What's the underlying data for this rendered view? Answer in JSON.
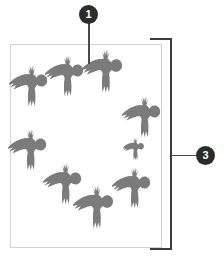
{
  "figure": {
    "title": "",
    "background_color": "#ffffff",
    "width": 224,
    "height": 258
  },
  "frame": {
    "name": "inner-field-rectangle",
    "stroke_color": "#d2d2d2",
    "x": 10,
    "y": 44,
    "width": 152,
    "height": 204
  },
  "bracket": {
    "name": "right-side-bracket",
    "stroke_color": "#3b3b3b",
    "x": 150,
    "y": 38,
    "width": 22,
    "height": 212
  },
  "callouts": [
    {
      "id": "1",
      "label": "1",
      "circle_color": "#2b2b2b",
      "text_color": "#ffffff",
      "cx": 88,
      "cy": 14,
      "leader": {
        "x": 88,
        "y": 22,
        "length": 42,
        "orientation": "vertical"
      }
    },
    {
      "id": "3",
      "label": "3",
      "circle_color": "#2b2b2b",
      "text_color": "#ffffff",
      "cx": 205,
      "cy": 155,
      "leader": {
        "x": 172,
        "y": 155,
        "length": 25,
        "orientation": "horizontal"
      }
    }
  ],
  "birds": {
    "name": "flying-bird-silhouettes",
    "fill_color": "#7b7b7b",
    "count": 9,
    "arrangement": "ring",
    "items": [
      {
        "index": 1,
        "x": 9,
        "y": 62,
        "scale": 1.0,
        "rotate": 0
      },
      {
        "index": 2,
        "x": 45,
        "y": 52,
        "scale": 1.0,
        "rotate": 0
      },
      {
        "index": 3,
        "x": 82,
        "y": 46,
        "scale": 1.05,
        "rotate": 0
      },
      {
        "index": 4,
        "x": 122,
        "y": 93,
        "scale": 1.0,
        "rotate": 0
      },
      {
        "index": 5,
        "x": 8,
        "y": 126,
        "scale": 1.0,
        "rotate": 0
      },
      {
        "index": 6,
        "x": 43,
        "y": 160,
        "scale": 1.0,
        "rotate": 0
      },
      {
        "index": 7,
        "x": 73,
        "y": 182,
        "scale": 1.05,
        "rotate": 0
      },
      {
        "index": 8,
        "x": 112,
        "y": 164,
        "scale": 1.0,
        "rotate": 0
      },
      {
        "index": 9,
        "x": 123,
        "y": 136,
        "scale": 0.55,
        "rotate": 0
      }
    ]
  }
}
